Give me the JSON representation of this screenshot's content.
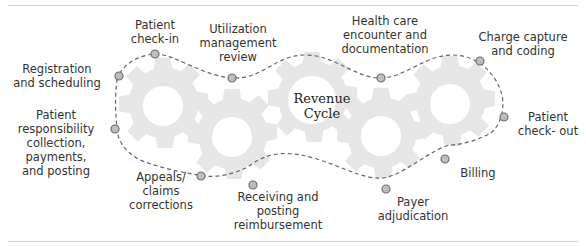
{
  "diagram": {
    "title": "Revenue\nCycle",
    "colors": {
      "gear": "#e6e6e6",
      "path": "#666666",
      "node_fill": "#bdbdbd",
      "node_stroke": "#6e6e6e",
      "text": "#333333",
      "rule": "#cfcfcf"
    },
    "steps": [
      {
        "label": "Registration\nand scheduling"
      },
      {
        "label": "Patient\ncheck-in"
      },
      {
        "label": "Utilization\nmanagement\nreview"
      },
      {
        "label": "Health care\nencounter and\ndocumentation"
      },
      {
        "label": "Charge capture\nand coding"
      },
      {
        "label": "Patient\ncheck- out"
      },
      {
        "label": "Billing"
      },
      {
        "label": "Payer\nadjudication"
      },
      {
        "label": "Receiving and\nposting\nreimbursement"
      },
      {
        "label": "Appeals/\nclaims\ncorrections"
      },
      {
        "label": "Patient\nresponsibility\ncollection,\npayments,\nand posting"
      }
    ]
  }
}
